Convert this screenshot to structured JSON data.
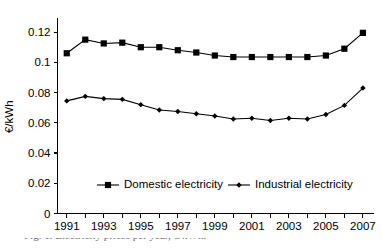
{
  "chart_data": {
    "type": "line",
    "title": "",
    "xlabel": "",
    "ylabel": "€/kWh",
    "x": [
      1991,
      1992,
      1993,
      1994,
      1995,
      1996,
      1997,
      1998,
      1999,
      2000,
      2001,
      2002,
      2003,
      2004,
      2005,
      2006,
      2007
    ],
    "xtick_labels": [
      "1991",
      "1993",
      "1995",
      "1997",
      "1999",
      "2001",
      "2003",
      "2005",
      "2007"
    ],
    "xtick_values": [
      1991,
      1993,
      1995,
      1997,
      1999,
      2001,
      2003,
      2005,
      2007
    ],
    "ytick_labels": [
      "0",
      "0.02",
      "0.04",
      "0.06",
      "0.08",
      "0.1",
      "0.12"
    ],
    "ytick_values": [
      0,
      0.02,
      0.04,
      0.06,
      0.08,
      0.1,
      0.12
    ],
    "ylim": [
      0,
      0.128
    ],
    "xlim": [
      1990.5,
      2007.6
    ],
    "grid": false,
    "legend_position": "bottom-center",
    "series": [
      {
        "name": "Domestic electricity",
        "marker": "square",
        "values": [
          0.106,
          0.115,
          0.1125,
          0.113,
          0.11,
          0.11,
          0.108,
          0.1065,
          0.1045,
          0.1035,
          0.1035,
          0.1035,
          0.1035,
          0.1035,
          0.1045,
          0.109,
          0.1195
        ]
      },
      {
        "name": "Industrial electricity",
        "marker": "diamond",
        "values": [
          0.0745,
          0.0775,
          0.076,
          0.0755,
          0.072,
          0.0685,
          0.0675,
          0.066,
          0.0645,
          0.0625,
          0.063,
          0.0615,
          0.063,
          0.0625,
          0.0655,
          0.0715,
          0.083
        ]
      }
    ]
  },
  "legend": {
    "entries": [
      {
        "label": "Domestic electricity",
        "marker": "square"
      },
      {
        "label": "Industrial electricity",
        "marker": "diamond"
      }
    ]
  },
  "caption": {
    "text": "Fig. 1. Electricity prices per year, €/kWh."
  }
}
